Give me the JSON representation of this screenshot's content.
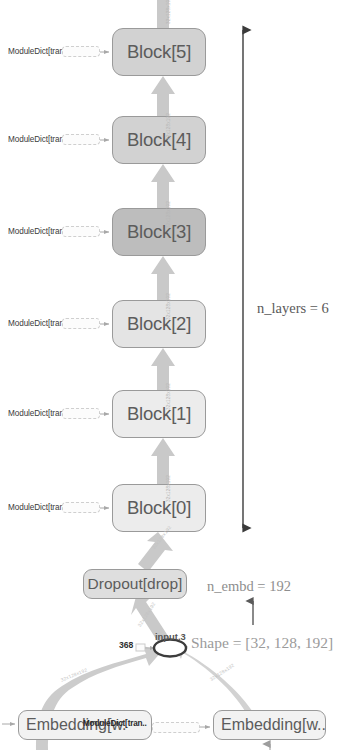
{
  "diagram": {
    "colors": {
      "node_fill_light": "#ededed",
      "node_fill_mid": "#d6d6d6",
      "node_fill_dark": "#bfbfbf",
      "node_border": "#9a9a9a",
      "node_text": "#5c5c5c",
      "arrow_fill": "#c8c8c8",
      "annotation_text": "#8e8e8e",
      "dim_arrow": "#6b6b6b",
      "background": "#ffffff"
    },
    "blocks": [
      {
        "label": "Block[5]",
        "top": 28,
        "fill": "#d2d2d2",
        "side_label": "ModuleDict[tran..",
        "edge_label": "32x128x192"
      },
      {
        "label": "Block[4]",
        "top": 116,
        "fill": "#d2d2d2",
        "side_label": "ModuleDict[tran..",
        "edge_label": "32x128x192"
      },
      {
        "label": "Block[3]",
        "top": 208,
        "fill": "#bdbdbd",
        "side_label": "ModuleDict[tran..",
        "edge_label": "32x128x192"
      },
      {
        "label": "Block[2]",
        "top": 300,
        "fill": "#e4e4e4",
        "side_label": "ModuleDict[tran..",
        "edge_label": "32x128x192"
      },
      {
        "label": "Block[1]",
        "top": 390,
        "fill": "#ececec",
        "side_label": "ModuleDict[tran..",
        "edge_label": "32x128x192"
      },
      {
        "label": "Block[0]",
        "top": 484,
        "fill": "#ececec",
        "side_label": "ModuleDict[tran..",
        "edge_label": "32x128x192"
      }
    ],
    "dropout": {
      "label": "Dropout[drop]",
      "fill": "#dedede",
      "edge_label_out": "32x128x192"
    },
    "embeddings": {
      "left": {
        "label": "Embedding[w.",
        "fill": "#f2f2f2",
        "edge_label": "32x128x192"
      },
      "right": {
        "label": "Embedding[w...",
        "fill": "#f2f2f2",
        "edge_label": "32x128x192"
      },
      "overlay_label": "ModuleDict[tran.."
    },
    "tensor_node": {
      "id_left": "368",
      "id_center": "input.3"
    },
    "annotations": {
      "n_layers": "n_layers = 6",
      "n_embd": "n_embd = 192",
      "shape": "Shape = [32, 128, 192]"
    }
  }
}
